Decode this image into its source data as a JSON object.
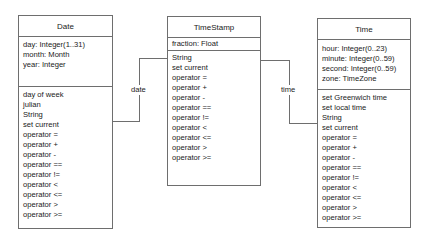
{
  "diagram": {
    "type": "UML class diagram",
    "classes": {
      "date": {
        "name": "Date",
        "attributes": [
          "day: Integer(1..31)",
          "month: Month",
          "year: Integer"
        ],
        "operations": [
          "day of week",
          "julian",
          "String",
          "set current",
          "operator =",
          "operator +",
          "operator -",
          "operator ==",
          "operator !=",
          "operator <",
          "operator <=",
          "operator >",
          "operator >="
        ]
      },
      "timestamp": {
        "name": "TimeStamp",
        "attributes": [
          "fraction: Float"
        ],
        "operations": [
          "String",
          "set current",
          "operator =",
          "operator +",
          "operator -",
          "operator ==",
          "operator !=",
          "operator <",
          "operator <=",
          "operator >",
          "operator >="
        ]
      },
      "time": {
        "name": "Time",
        "attributes": [
          "hour: Integer(0..23)",
          "minute: Integer(0..59)",
          "second: Integer(0..59)",
          "zone: TimeZone"
        ],
        "operations": [
          "set Greenwich time",
          "set local time",
          "String",
          "set current",
          "operator =",
          "operator +",
          "operator -",
          "operator ==",
          "operator !=",
          "operator <",
          "operator <=",
          "operator >",
          "operator >="
        ]
      }
    },
    "associations": {
      "date_timestamp": {
        "label": "date",
        "from": "TimeStamp",
        "to": "Date"
      },
      "timestamp_time": {
        "label": "time",
        "from": "TimeStamp",
        "to": "Time"
      }
    },
    "colors": {
      "line": "#6e6e6e",
      "text": "#1a1a1a",
      "background": "#ffffff"
    }
  }
}
